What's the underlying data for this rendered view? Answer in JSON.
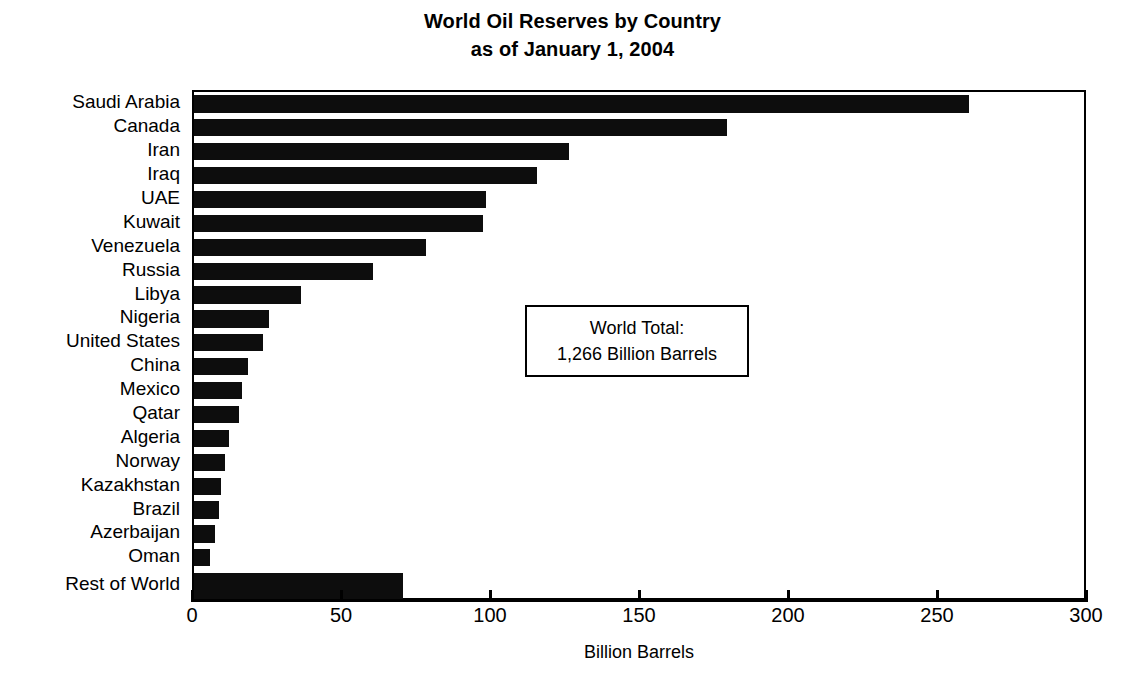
{
  "chart_data": {
    "type": "bar",
    "orientation": "horizontal",
    "title": "World Oil Reserves by Country as of January 1, 2004",
    "title_lines": [
      "World Oil Reserves by Country",
      "as of January 1, 2004"
    ],
    "xlabel": "Billion Barrels",
    "ylabel": "",
    "xlim": [
      0,
      300
    ],
    "xticks": [
      0,
      50,
      100,
      150,
      200,
      250,
      300
    ],
    "xtick_labels": [
      "0",
      "50",
      "100",
      "150",
      "200",
      "250",
      "300"
    ],
    "grid": false,
    "legend": false,
    "bar_color": "#0d0d0d",
    "categories": [
      "Saudi Arabia",
      "Canada",
      "Iran",
      "Iraq",
      "UAE",
      "Kuwait",
      "Venezuela",
      "Russia",
      "Libya",
      "Nigeria",
      "United States",
      "China",
      "Mexico",
      "Qatar",
      "Algeria",
      "Norway",
      "Kazakhstan",
      "Brazil",
      "Azerbaijan",
      "Oman",
      "Rest of World"
    ],
    "values": [
      260,
      179,
      126,
      115,
      98,
      97,
      78,
      60,
      36,
      25,
      23,
      18,
      16,
      15,
      11.8,
      10.5,
      9.0,
      8.5,
      7.0,
      5.5,
      70
    ],
    "annotations": [
      {
        "name": "world-total-box",
        "lines": [
          "World Total:",
          "1,266 Billion Barrels"
        ]
      }
    ]
  }
}
